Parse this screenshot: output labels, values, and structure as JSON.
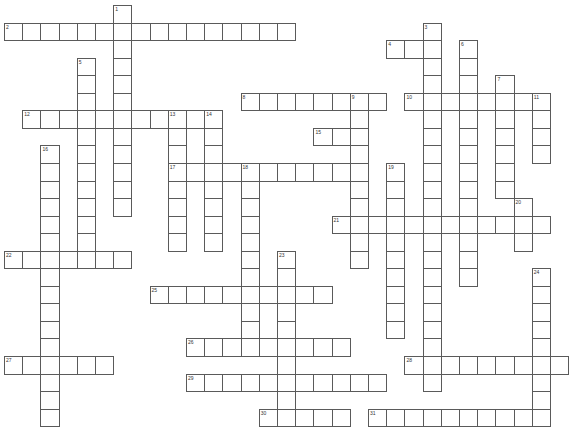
{
  "puzzle": {
    "type": "crossword",
    "grid": {
      "origin_x": 4,
      "origin_y": 5,
      "cell_w": 18.2,
      "cell_h": 17.55,
      "cols": 31,
      "rows": 24
    },
    "colors": {
      "line": "#5a5a5a",
      "background": "#ffffff",
      "number": "#333333"
    },
    "words": [
      {
        "num": "1",
        "dir": "down",
        "row": 0,
        "col": 6,
        "len": 12
      },
      {
        "num": "2",
        "dir": "across",
        "row": 1,
        "col": 0,
        "len": 16
      },
      {
        "num": "3",
        "dir": "down",
        "row": 1,
        "col": 23,
        "len": 21
      },
      {
        "num": "4",
        "dir": "across",
        "row": 2,
        "col": 21,
        "len": 3
      },
      {
        "num": "5",
        "dir": "down",
        "row": 3,
        "col": 4,
        "len": 12
      },
      {
        "num": "6",
        "dir": "down",
        "row": 2,
        "col": 25,
        "len": 14
      },
      {
        "num": "7",
        "dir": "down",
        "row": 4,
        "col": 27,
        "len": 7
      },
      {
        "num": "8",
        "dir": "across",
        "row": 5,
        "col": 13,
        "len": 8
      },
      {
        "num": "9",
        "dir": "down",
        "row": 5,
        "col": 19,
        "len": 10
      },
      {
        "num": "10",
        "dir": "across",
        "row": 5,
        "col": 22,
        "len": 8
      },
      {
        "num": "11",
        "dir": "down",
        "row": 5,
        "col": 29,
        "len": 4
      },
      {
        "num": "12",
        "dir": "across",
        "row": 6,
        "col": 1,
        "len": 10
      },
      {
        "num": "13",
        "dir": "down",
        "row": 6,
        "col": 9,
        "len": 8
      },
      {
        "num": "14",
        "dir": "down",
        "row": 6,
        "col": 11,
        "len": 8
      },
      {
        "num": "15",
        "dir": "across",
        "row": 7,
        "col": 17,
        "len": 3
      },
      {
        "num": "16",
        "dir": "down",
        "row": 8,
        "col": 2,
        "len": 16
      },
      {
        "num": "17",
        "dir": "across",
        "row": 9,
        "col": 9,
        "len": 10
      },
      {
        "num": "18",
        "dir": "down",
        "row": 9,
        "col": 13,
        "len": 11
      },
      {
        "num": "19",
        "dir": "down",
        "row": 9,
        "col": 21,
        "len": 10
      },
      {
        "num": "20",
        "dir": "down",
        "row": 11,
        "col": 28,
        "len": 3
      },
      {
        "num": "21",
        "dir": "across",
        "row": 12,
        "col": 18,
        "len": 12
      },
      {
        "num": "22",
        "dir": "across",
        "row": 14,
        "col": 0,
        "len": 7
      },
      {
        "num": "23",
        "dir": "down",
        "row": 14,
        "col": 15,
        "len": 10
      },
      {
        "num": "24",
        "dir": "down",
        "row": 15,
        "col": 29,
        "len": 9
      },
      {
        "num": "25",
        "dir": "across",
        "row": 16,
        "col": 8,
        "len": 10
      },
      {
        "num": "26",
        "dir": "across",
        "row": 19,
        "col": 10,
        "len": 9
      },
      {
        "num": "27",
        "dir": "across",
        "row": 20,
        "col": 0,
        "len": 6
      },
      {
        "num": "28",
        "dir": "across",
        "row": 20,
        "col": 22,
        "len": 9
      },
      {
        "num": "29",
        "dir": "across",
        "row": 21,
        "col": 10,
        "len": 11
      },
      {
        "num": "30",
        "dir": "across",
        "row": 23,
        "col": 14,
        "len": 5
      },
      {
        "num": "31",
        "dir": "across",
        "row": 23,
        "col": 20,
        "len": 10
      }
    ]
  }
}
